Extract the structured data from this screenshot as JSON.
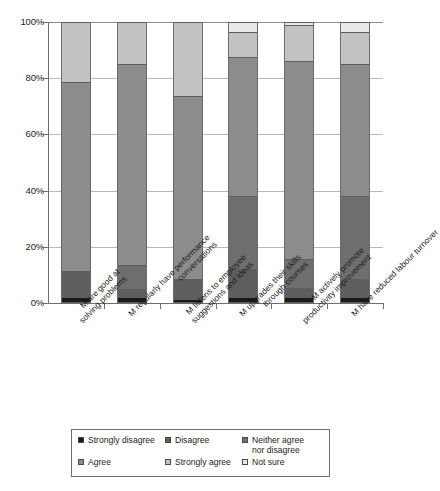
{
  "chart_data": {
    "type": "bar",
    "subtype": "100% stacked bar",
    "title": "",
    "subtitle": "",
    "xlabel": "",
    "ylabel": "",
    "ylim": [
      0,
      100
    ],
    "yticks": [
      0,
      20,
      40,
      60,
      80,
      100
    ],
    "ytick_labels": [
      "0%",
      "20%",
      "40%",
      "60%",
      "80%",
      "100%"
    ],
    "grid": true,
    "grid_axis": "y",
    "legend_position": "bottom",
    "stacked_total": 100,
    "categories": [
      "M are good at solving problems",
      "M regularly have performance conversations",
      "M listens to employee suggestions and ideas",
      "M upgrades their skills through courses",
      "M actively promote productivity improvement",
      "M have reduced labour turnover"
    ],
    "category_label_lines": [
      [
        "M are good at",
        "solving problems"
      ],
      [
        "M regularly have performance",
        "conversations"
      ],
      [
        "M listens to employee",
        "suggestions and ideas"
      ],
      [
        "M upgrades their skills",
        "through courses"
      ],
      [
        "M actively promote",
        "productivity improvement"
      ],
      [
        "M have reduced labour turnover"
      ]
    ],
    "series": [
      {
        "name": "Strongly disagree",
        "color": "#1a1a1a",
        "values": [
          2.0,
          2.0,
          1.5,
          2.0,
          2.0,
          2.0
        ]
      },
      {
        "name": "Disagree",
        "color": "#5e5e5e",
        "values": [
          9.5,
          3.0,
          7.0,
          10.0,
          3.5,
          6.5
        ]
      },
      {
        "name": "Neither agree nor disagree",
        "color": "#6e6e6e",
        "values": [
          0.0,
          8.5,
          0.0,
          26.0,
          10.0,
          29.5
        ]
      },
      {
        "name": "Agree",
        "color": "#8c8c8c",
        "values": [
          67.0,
          71.5,
          65.0,
          49.5,
          70.5,
          47.0
        ]
      },
      {
        "name": "Strongly agree",
        "color": "#c2c2c2",
        "values": [
          21.5,
          15.0,
          26.5,
          9.0,
          13.0,
          11.5
        ]
      },
      {
        "name": "Not sure",
        "color": "#e8e8e8",
        "values": [
          0.0,
          0.0,
          0.0,
          3.5,
          1.0,
          3.5
        ]
      }
    ]
  },
  "axis": {
    "y_tick_labels": [
      "100%",
      "80%",
      "60%",
      "40%",
      "20%",
      "0%"
    ]
  },
  "legend": {
    "entries": [
      {
        "label": "Strongly disagree",
        "color": "#1a1a1a"
      },
      {
        "label": "Disagree",
        "color": "#5e5e5e"
      },
      {
        "label": "Neither agree\nnor disagree",
        "color": "#6e6e6e"
      },
      {
        "label": "Agree",
        "color": "#8c8c8c"
      },
      {
        "label": "Strongly agree",
        "color": "#c2c2c2"
      },
      {
        "label": "Not sure",
        "color": "#e8e8e8"
      }
    ]
  }
}
